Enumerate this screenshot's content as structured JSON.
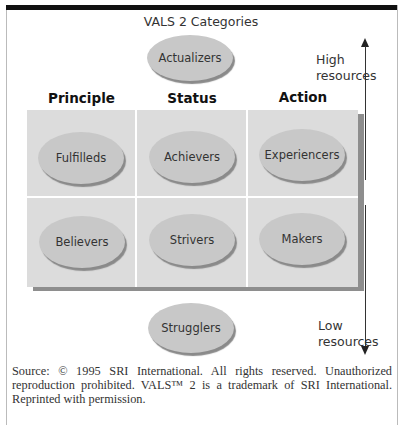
{
  "title": "VALS 2 Categories",
  "top_category": "Actualizers",
  "bottom_category": "Strugglers",
  "columns": [
    "Principle",
    "Status",
    "Action"
  ],
  "grid": [
    [
      "Fulfilleds",
      "Achievers",
      "Experiencers"
    ],
    [
      "Believers",
      "Strivers",
      "Makers"
    ]
  ],
  "resource_axis": {
    "high_line1": "High",
    "high_line2": "resources",
    "low_line1": "Low",
    "low_line2": "resources"
  },
  "source_text": "Source: © 1995 SRI International. All rights reserved. Unauthorized reproduction prohibited. VALS™ 2 is a trademark of SRI International. Reprinted with permission.",
  "colors": {
    "cell_bg": "#dcdcdc",
    "ellipse_fill": "#c8c8c8",
    "shadow": "#8e8e8e",
    "top_bar": "#111111"
  }
}
